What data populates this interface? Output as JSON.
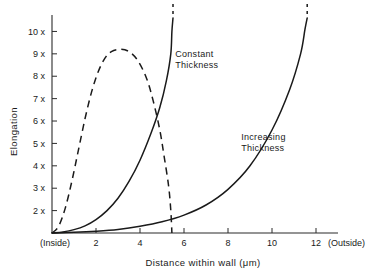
{
  "chart_data": {
    "type": "line",
    "title": "",
    "xlabel": "Distance within wall (μm)",
    "ylabel": "Elongation",
    "xlim": [
      0,
      13
    ],
    "ylim": [
      1,
      10.6
    ],
    "grid": false,
    "legend_position": "inline-annotations",
    "x_ticks": [
      {
        "value": 2,
        "label": "2"
      },
      {
        "value": 4,
        "label": "4"
      },
      {
        "value": 6,
        "label": "6"
      },
      {
        "value": 8,
        "label": "8"
      },
      {
        "value": 10,
        "label": "10"
      },
      {
        "value": 12,
        "label": "12"
      }
    ],
    "y_ticks": [
      {
        "value": 2,
        "label": "2 x"
      },
      {
        "value": 3,
        "label": "3 x"
      },
      {
        "value": 4,
        "label": "4 x"
      },
      {
        "value": 5,
        "label": "5 x"
      },
      {
        "value": 6,
        "label": "6 x"
      },
      {
        "value": 7,
        "label": "7 x"
      },
      {
        "value": 8,
        "label": "8 x"
      },
      {
        "value": 9,
        "label": "9 x"
      },
      {
        "value": 10,
        "label": "10 x"
      }
    ],
    "x_edge_labels": {
      "left": "(Inside)",
      "right": "(Outside)"
    },
    "series": [
      {
        "name": "Constant Thickness",
        "style": "solid",
        "label_x": 5.6,
        "label_y": 8.85,
        "truncated_at_top": true,
        "points": [
          [
            0.0,
            1.0
          ],
          [
            0.5,
            1.05
          ],
          [
            1.0,
            1.15
          ],
          [
            1.5,
            1.32
          ],
          [
            2.0,
            1.6
          ],
          [
            2.5,
            2.0
          ],
          [
            3.0,
            2.55
          ],
          [
            3.5,
            3.3
          ],
          [
            4.0,
            4.25
          ],
          [
            4.5,
            5.45
          ],
          [
            4.9,
            6.6
          ],
          [
            5.2,
            7.8
          ],
          [
            5.4,
            9.0
          ],
          [
            5.45,
            10.0
          ],
          [
            5.5,
            10.6
          ]
        ]
      },
      {
        "name": "Increasing Thickness",
        "style": "solid",
        "label_x": 8.6,
        "label_y": 5.15,
        "truncated_at_top": true,
        "points": [
          [
            0.0,
            1.0
          ],
          [
            1.0,
            1.03
          ],
          [
            2.0,
            1.08
          ],
          [
            3.0,
            1.16
          ],
          [
            4.0,
            1.3
          ],
          [
            5.0,
            1.5
          ],
          [
            6.0,
            1.8
          ],
          [
            7.0,
            2.25
          ],
          [
            8.0,
            2.95
          ],
          [
            9.0,
            4.0
          ],
          [
            10.0,
            5.6
          ],
          [
            10.8,
            7.4
          ],
          [
            11.3,
            9.0
          ],
          [
            11.5,
            10.1
          ],
          [
            11.6,
            10.6
          ]
        ]
      },
      {
        "name": "Strain rate (dashed)",
        "style": "dashed",
        "points": [
          [
            0.0,
            1.0
          ],
          [
            0.3,
            1.3
          ],
          [
            0.6,
            2.1
          ],
          [
            0.9,
            3.3
          ],
          [
            1.2,
            4.7
          ],
          [
            1.5,
            6.1
          ],
          [
            1.8,
            7.3
          ],
          [
            2.1,
            8.2
          ],
          [
            2.4,
            8.8
          ],
          [
            2.7,
            9.1
          ],
          [
            3.1,
            9.2
          ],
          [
            3.5,
            9.1
          ],
          [
            3.9,
            8.7
          ],
          [
            4.3,
            7.9
          ],
          [
            4.6,
            6.9
          ],
          [
            4.9,
            5.6
          ],
          [
            5.1,
            4.4
          ],
          [
            5.3,
            3.1
          ],
          [
            5.4,
            2.0
          ],
          [
            5.45,
            1.0
          ]
        ]
      }
    ]
  }
}
